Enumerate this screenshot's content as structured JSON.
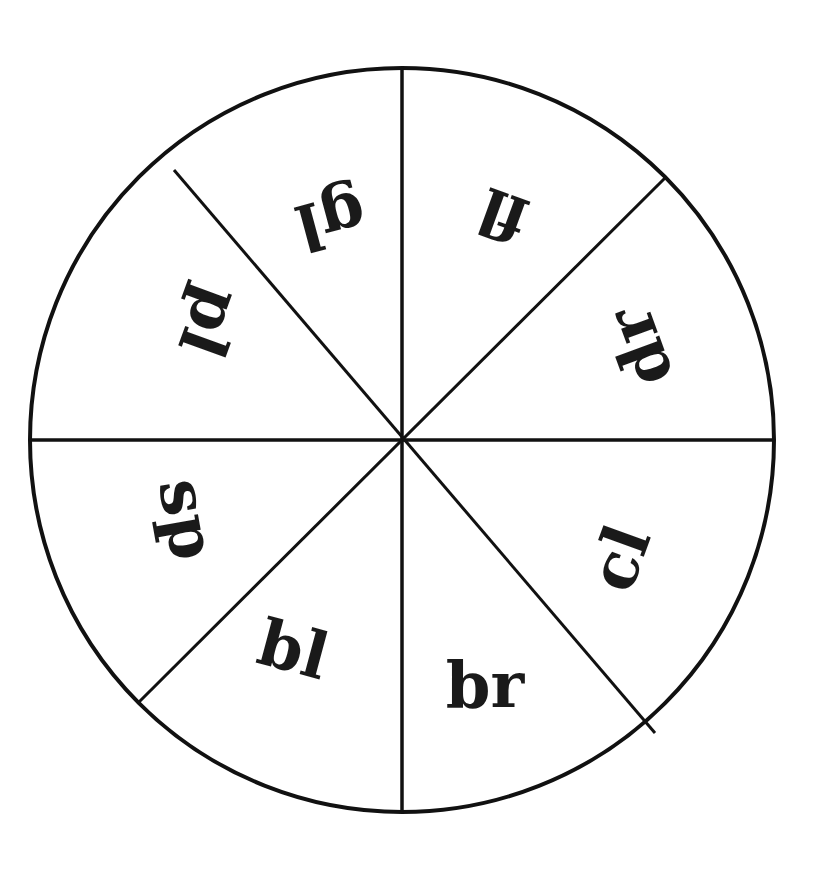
{
  "diagram": {
    "type": "consonant-blend-wheel",
    "center": [
      402,
      440
    ],
    "radius": 372,
    "stroke_color": "#111111",
    "background": "#ffffff",
    "segments": [
      {
        "label": "fl",
        "angle_deg": 112,
        "rotation_deg": 200
      },
      {
        "label": "dr",
        "angle_deg": 67,
        "rotation_deg": 250
      },
      {
        "label": "cl",
        "angle_deg": 22,
        "rotation_deg": 290
      },
      {
        "label": "br",
        "angle_deg": -22,
        "rotation_deg": 0
      },
      {
        "label": "bl",
        "angle_deg": -67,
        "rotation_deg": 15
      },
      {
        "label": "sp",
        "angle_deg": -112,
        "rotation_deg": 80
      },
      {
        "label": "pl",
        "angle_deg": -157,
        "rotation_deg": 110
      },
      {
        "label": "gl",
        "angle_deg": 157,
        "rotation_deg": 165
      }
    ]
  }
}
